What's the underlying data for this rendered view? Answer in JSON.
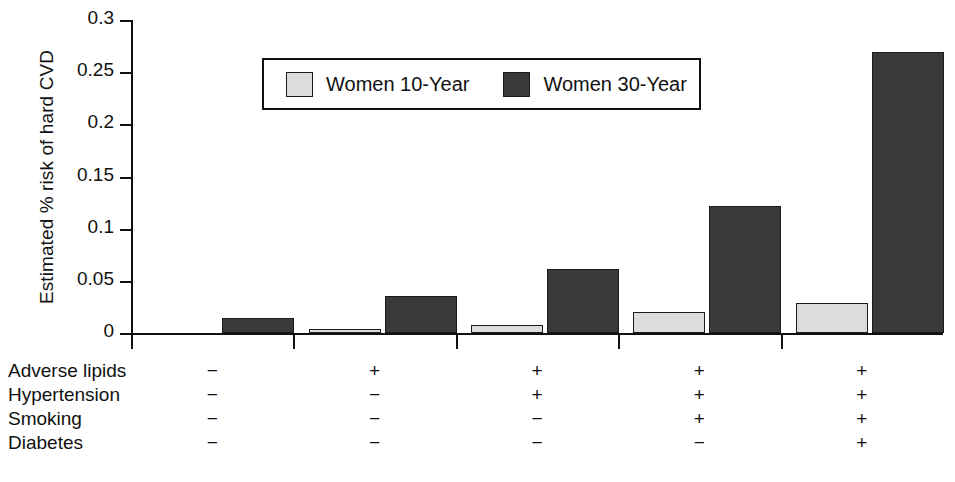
{
  "chart_data": {
    "type": "bar",
    "title": "",
    "subtitle": "",
    "xlabel": "",
    "ylabel": "Estimated % risk of hard CVD",
    "ylim": [
      0,
      0.3
    ],
    "ytick_values": [
      0,
      0.05,
      0.1,
      0.15,
      0.2,
      0.25,
      0.3
    ],
    "ytick_labels": [
      "0",
      "0.05",
      "0.1",
      "0.15",
      "0.2",
      "0.25",
      "0.3"
    ],
    "grid": false,
    "legend_position": "top-center",
    "categories": [
      "Group 1",
      "Group 2",
      "Group 3",
      "Group 4",
      "Group 5"
    ],
    "series": [
      {
        "name": "Women 10-Year",
        "color": "#dcdcdc",
        "values": [
          0.0,
          0.004,
          0.008,
          0.02,
          0.029
        ]
      },
      {
        "name": "Women 30-Year",
        "color": "#3a3a3a",
        "values": [
          0.014,
          0.035,
          0.061,
          0.122,
          0.269
        ]
      }
    ],
    "risk_factor_table": {
      "rows": [
        {
          "label": "Adverse lipids",
          "values": [
            "−",
            "+",
            "+",
            "+",
            "+"
          ]
        },
        {
          "label": "Hypertension",
          "values": [
            "−",
            "−",
            "+",
            "+",
            "+"
          ]
        },
        {
          "label": "Smoking",
          "values": [
            "−",
            "−",
            "−",
            "+",
            "+"
          ]
        },
        {
          "label": "Diabetes",
          "values": [
            "−",
            "−",
            "−",
            "−",
            "+"
          ]
        }
      ]
    }
  },
  "legend": {
    "entries": [
      {
        "label": "Women 10-Year",
        "color": "#dcdcdc"
      },
      {
        "label": "Women 30-Year",
        "color": "#3a3a3a"
      }
    ]
  },
  "axis": {
    "ylabel": "Estimated % risk of hard CVD",
    "yticks": [
      "0.3",
      "0.25",
      "0.2",
      "0.15",
      "0.1",
      "0.05",
      "0"
    ]
  },
  "factors": {
    "rows": [
      {
        "name": "Adverse lipids",
        "cells": [
          "−",
          "+",
          "+",
          "+",
          "+"
        ]
      },
      {
        "name": "Hypertension",
        "cells": [
          "−",
          "−",
          "+",
          "+",
          "+"
        ]
      },
      {
        "name": "Smoking",
        "cells": [
          "−",
          "−",
          "−",
          "+",
          "+"
        ]
      },
      {
        "name": "Diabetes",
        "cells": [
          "−",
          "−",
          "−",
          "−",
          "+"
        ]
      }
    ]
  },
  "caption": {
    "text": ""
  },
  "colors": {
    "series_10_year": "#dcdcdc",
    "series_30_year": "#3a3a3a",
    "axis": "#111111",
    "background": "#ffffff"
  }
}
